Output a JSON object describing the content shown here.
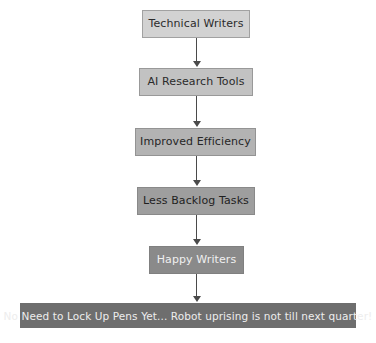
{
  "diagram": {
    "type": "flowchart",
    "orientation": "top-to-bottom",
    "title_visible": false,
    "background_color": "#ffffff",
    "arrow_color": "#4a4a4a",
    "nodes": [
      {
        "id": "technical-writers",
        "label": "Technical Writers",
        "fill": "#d2d2d2",
        "text_color": "#2b2b2b",
        "x": 142,
        "y": 10,
        "width": 108,
        "height": 28,
        "font_size": 11
      },
      {
        "id": "ai-research-tools",
        "label": "AI Research Tools",
        "fill": "#c2c2c2",
        "text_color": "#2b2b2b",
        "x": 139,
        "y": 68,
        "width": 114,
        "height": 28,
        "font_size": 11
      },
      {
        "id": "improved-efficiency",
        "label": "Improved Efficiency",
        "fill": "#b3b3b3",
        "text_color": "#262626",
        "x": 135,
        "y": 128,
        "width": 121,
        "height": 28,
        "font_size": 11
      },
      {
        "id": "less-backlog-tasks",
        "label": "Less Backlog Tasks",
        "fill": "#9e9e9e",
        "text_color": "#1f1f1f",
        "x": 137,
        "y": 187,
        "width": 118,
        "height": 28,
        "font_size": 11
      },
      {
        "id": "happy-writers",
        "label": "Happy Writers",
        "fill": "#8a8a8a",
        "text_color": "#f0f0f0",
        "x": 149,
        "y": 246,
        "width": 95,
        "height": 28,
        "font_size": 11
      }
    ],
    "banner": {
      "id": "closing-banner",
      "label": "No Need to Lock Up Pens Yet... Robot uprising is not till next quarter!",
      "fill": "#6e6e6e",
      "text_color": "#ededed",
      "x": 20,
      "y": 303,
      "width": 336,
      "height": 25,
      "font_size": 10.5
    },
    "connectors": [
      {
        "id": "conn-1",
        "from": "technical-writers",
        "to": "ai-research-tools",
        "x": 196,
        "y": 38,
        "length": 24
      },
      {
        "id": "conn-2",
        "from": "ai-research-tools",
        "to": "improved-efficiency",
        "x": 196,
        "y": 96,
        "length": 26
      },
      {
        "id": "conn-3",
        "from": "improved-efficiency",
        "to": "less-backlog-tasks",
        "x": 196,
        "y": 156,
        "length": 25
      },
      {
        "id": "conn-4",
        "from": "less-backlog-tasks",
        "to": "happy-writers",
        "x": 196,
        "y": 215,
        "length": 25
      },
      {
        "id": "conn-5",
        "from": "happy-writers",
        "to": "closing-banner",
        "x": 196,
        "y": 274,
        "length": 23
      }
    ]
  }
}
